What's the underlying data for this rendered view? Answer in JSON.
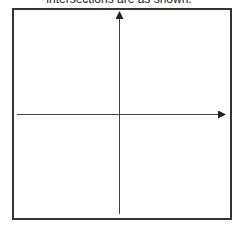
{
  "caption": {
    "text": "intersections are as shown."
  },
  "diagram": {
    "type": "coordinate-axes",
    "frame": {
      "stroke": "#333333"
    },
    "x_axis": {
      "arrow": "right",
      "color": "#333333"
    },
    "y_axis": {
      "arrow": "up",
      "color": "#333333"
    }
  }
}
